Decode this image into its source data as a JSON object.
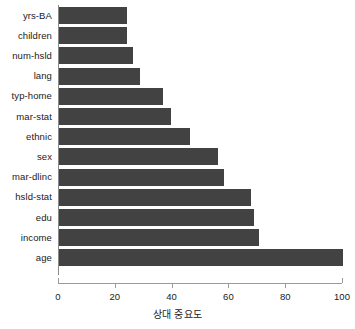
{
  "chart_data": {
    "type": "bar",
    "orientation": "horizontal",
    "title": "",
    "xlabel": "상대 중요도",
    "ylabel": "",
    "xlim": [
      0,
      100
    ],
    "xticks": [
      0,
      20,
      40,
      60,
      80,
      100
    ],
    "grid": false,
    "legend": null,
    "bar_color": "#424242",
    "axis_color": "#9a9a9a",
    "categories": [
      "yrs-BA",
      "children",
      "num-hsld",
      "lang",
      "typ-home",
      "mar-stat",
      "ethnic",
      "sex",
      "mar-dlinc",
      "hsld-stat",
      "edu",
      "income",
      "age"
    ],
    "values": [
      24,
      24,
      26,
      28.5,
      36.5,
      39.5,
      46,
      56,
      58,
      67.5,
      68.5,
      70.5,
      100
    ],
    "bars": [
      {
        "label": "yrs-BA",
        "value": 24
      },
      {
        "label": "children",
        "value": 24
      },
      {
        "label": "num-hsld",
        "value": 26
      },
      {
        "label": "lang",
        "value": 28.5
      },
      {
        "label": "typ-home",
        "value": 36.5
      },
      {
        "label": "mar-stat",
        "value": 39.5
      },
      {
        "label": "ethnic",
        "value": 46
      },
      {
        "label": "sex",
        "value": 56
      },
      {
        "label": "mar-dlinc",
        "value": 58
      },
      {
        "label": "hsld-stat",
        "value": 67.5
      },
      {
        "label": "edu",
        "value": 68.5
      },
      {
        "label": "income",
        "value": 70.5
      },
      {
        "label": "age",
        "value": 100
      }
    ]
  }
}
